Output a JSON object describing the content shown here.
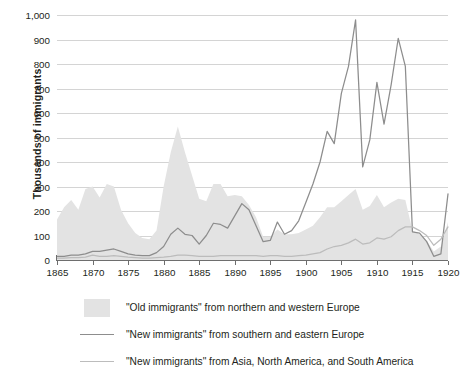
{
  "chart_data": {
    "type": "area",
    "title": "",
    "subtitle": "",
    "xlabel": "",
    "ylabel": "Thousands of immigrants",
    "xlim": [
      1865,
      1920
    ],
    "ylim": [
      0,
      1000
    ],
    "grid": true,
    "legend_position": "bottom-left",
    "y_ticks": [
      0,
      100,
      200,
      300,
      400,
      500,
      600,
      700,
      800,
      900,
      1000
    ],
    "y_tick_labels": [
      "0",
      "100",
      "200",
      "300",
      "400",
      "500",
      "600",
      "700",
      "800",
      "900",
      "1,000"
    ],
    "x_ticks": [
      1865,
      1870,
      1875,
      1880,
      1885,
      1890,
      1895,
      1900,
      1905,
      1910,
      1915,
      1920
    ],
    "x_tick_labels": [
      "1865",
      "1870",
      "1875",
      "1880",
      "1885",
      "1890",
      "1895",
      "1900",
      "1905",
      "1910",
      "1915",
      "1920"
    ],
    "x": [
      1865,
      1866,
      1867,
      1868,
      1869,
      1870,
      1871,
      1872,
      1873,
      1874,
      1875,
      1876,
      1877,
      1878,
      1879,
      1880,
      1881,
      1882,
      1883,
      1884,
      1885,
      1886,
      1887,
      1888,
      1889,
      1890,
      1891,
      1892,
      1893,
      1894,
      1895,
      1896,
      1897,
      1898,
      1899,
      1900,
      1901,
      1902,
      1903,
      1904,
      1905,
      1906,
      1907,
      1908,
      1909,
      1910,
      1911,
      1912,
      1913,
      1914,
      1915,
      1916,
      1917,
      1918,
      1919,
      1920
    ],
    "series": [
      {
        "name": "\"Old immigrants\" from northern and western Europe",
        "render": "area",
        "color": "#e3e3e3",
        "values": [
          165,
          215,
          245,
          205,
          290,
          300,
          255,
          310,
          300,
          205,
          150,
          110,
          90,
          85,
          120,
          300,
          440,
          545,
          440,
          345,
          250,
          240,
          310,
          310,
          260,
          265,
          260,
          225,
          175,
          95,
          95,
          125,
          105,
          105,
          110,
          125,
          140,
          175,
          215,
          215,
          240,
          265,
          290,
          205,
          220,
          265,
          215,
          235,
          250,
          245,
          120,
          105,
          80,
          35,
          55,
          155
        ]
      },
      {
        "name": "\"New immigrants\" from southern and eastern Europe",
        "render": "line",
        "color": "#8d8d8d",
        "values": [
          15,
          15,
          20,
          20,
          25,
          35,
          35,
          40,
          45,
          35,
          25,
          20,
          18,
          18,
          30,
          55,
          105,
          130,
          105,
          100,
          65,
          100,
          150,
          145,
          130,
          180,
          230,
          205,
          140,
          75,
          80,
          155,
          105,
          120,
          160,
          235,
          310,
          400,
          525,
          475,
          680,
          790,
          980,
          380,
          490,
          725,
          555,
          715,
          905,
          790,
          115,
          110,
          75,
          15,
          25,
          270
        ]
      },
      {
        "name": "\"New immigrants\" from Asia, North America, and South America",
        "render": "line",
        "color": "#bcbcbc",
        "values": [
          8,
          8,
          10,
          10,
          12,
          20,
          15,
          15,
          18,
          15,
          12,
          10,
          8,
          8,
          10,
          12,
          15,
          20,
          20,
          18,
          15,
          15,
          15,
          18,
          18,
          18,
          18,
          18,
          18,
          15,
          18,
          18,
          15,
          15,
          18,
          20,
          25,
          30,
          45,
          55,
          60,
          70,
          85,
          65,
          70,
          90,
          85,
          95,
          120,
          135,
          135,
          120,
          100,
          60,
          85,
          135
        ]
      }
    ]
  },
  "legend": {
    "items": [
      {
        "key": "area-swatch",
        "label": "\"Old immigrants\" from northern and western Europe"
      },
      {
        "key": "line-swatch-dark",
        "label": "\"New immigrants\" from southern and eastern Europe"
      },
      {
        "key": "line-swatch-light",
        "label": "\"New immigrants\" from Asia, North America, and South America"
      }
    ]
  }
}
